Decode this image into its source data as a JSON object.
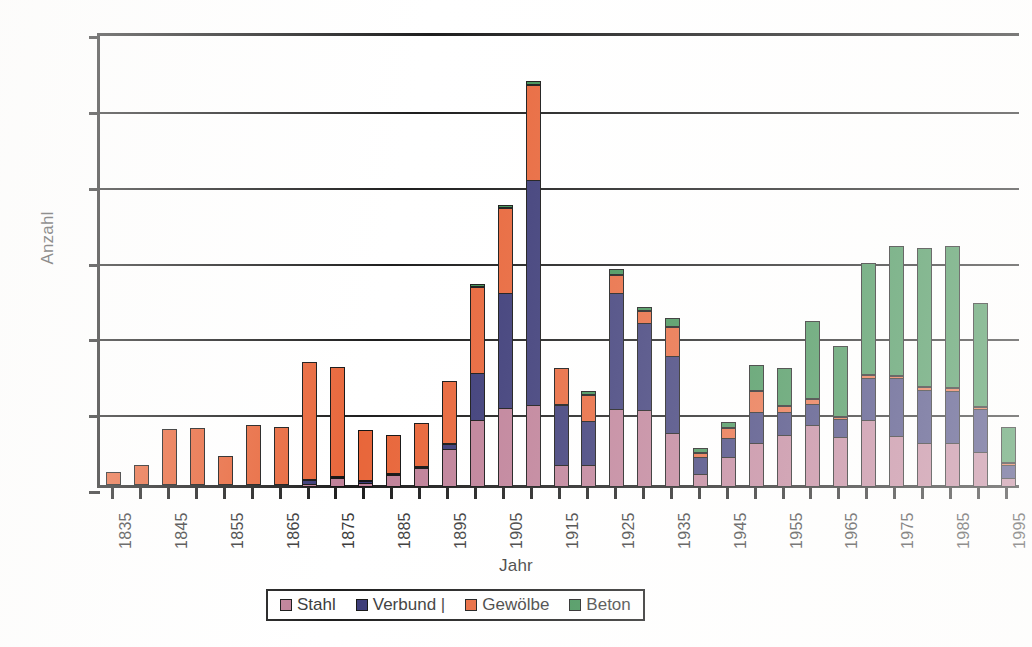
{
  "chart_data": {
    "type": "bar",
    "subtype": "stacked-vertical",
    "title": "",
    "xlabel": "Jahr",
    "ylabel": "Anzahl",
    "ylim": [
      0,
      3000
    ],
    "ytick_step": 500,
    "yticks": [
      0,
      500,
      1000,
      1500,
      2000,
      2500,
      3000
    ],
    "ytick_labels": [
      "0",
      "500",
      "1000",
      "1500",
      "2000",
      "2500",
      "3000"
    ],
    "grid": true,
    "grid_axis": "y",
    "legend_position": "bottom-center",
    "xtick_step": 5,
    "xtick_label_step": 10,
    "x_first": 1835,
    "x_last": 1995,
    "categories": [
      1835,
      1840,
      1845,
      1850,
      1855,
      1860,
      1865,
      1870,
      1875,
      1880,
      1885,
      1890,
      1895,
      1900,
      1905,
      1910,
      1915,
      1920,
      1925,
      1930,
      1935,
      1940,
      1945,
      1950,
      1955,
      1960,
      1965,
      1970,
      1975,
      1980,
      1985,
      1990,
      1995
    ],
    "xtick_labels": [
      "1835",
      "",
      "1845",
      "",
      "1855",
      "",
      "1865",
      "",
      "1875",
      "",
      "1885",
      "",
      "1895",
      "",
      "1905",
      "",
      "1915",
      "",
      "1925",
      "",
      "1935",
      "",
      "1945",
      "",
      "1955",
      "",
      "1965",
      "",
      "1975",
      "",
      "1985",
      "",
      "1995"
    ],
    "series": [
      {
        "name": "Stahl",
        "color": "#bf8098",
        "values": [
          0,
          0,
          0,
          0,
          0,
          0,
          0,
          0,
          0,
          0,
          0,
          0,
          0,
          0,
          0,
          0,
          0,
          0,
          0,
          0,
          0,
          0,
          0,
          0,
          0,
          0,
          0,
          0,
          0,
          0,
          0,
          0,
          0
        ]
      },
      {
        "name": "Verbund |",
        "color": "#3b3a77",
        "values": [
          0,
          0,
          0,
          0,
          0,
          0,
          0,
          0,
          0,
          0,
          0,
          0,
          0,
          0,
          0,
          0,
          0,
          0,
          0,
          0,
          0,
          0,
          0,
          0,
          0,
          0,
          0,
          0,
          0,
          0,
          0,
          0,
          0
        ]
      },
      {
        "name": "Gewölbe",
        "color": "#e8663a",
        "values": [
          0,
          0,
          0,
          0,
          0,
          0,
          0,
          0,
          0,
          0,
          0,
          0,
          0,
          0,
          0,
          0,
          0,
          0,
          0,
          0,
          0,
          0,
          0,
          0,
          0,
          0,
          0,
          0,
          0,
          0,
          0,
          0,
          0
        ]
      },
      {
        "name": "Beton",
        "color": "#3d8f52",
        "values": [
          0,
          0,
          0,
          0,
          0,
          0,
          0,
          0,
          0,
          0,
          0,
          0,
          0,
          0,
          0,
          0,
          0,
          0,
          0,
          0,
          0,
          0,
          0,
          0,
          0,
          0,
          0,
          0,
          0,
          0,
          0,
          0,
          0
        ]
      }
    ],
    "stacks": [
      {
        "year": 1835,
        "Stahl": 0,
        "Verbund": 0,
        "Gewoelbe": 85,
        "Beton": 0,
        "total": 85
      },
      {
        "year": 1840,
        "Stahl": 0,
        "Verbund": 0,
        "Gewoelbe": 135,
        "Beton": 0,
        "total": 135
      },
      {
        "year": 1845,
        "Stahl": 0,
        "Verbund": 0,
        "Gewoelbe": 370,
        "Beton": 0,
        "total": 370
      },
      {
        "year": 1850,
        "Stahl": 0,
        "Verbund": 0,
        "Gewoelbe": 375,
        "Beton": 0,
        "total": 375
      },
      {
        "year": 1855,
        "Stahl": 0,
        "Verbund": 0,
        "Gewoelbe": 190,
        "Beton": 0,
        "total": 190
      },
      {
        "year": 1860,
        "Stahl": 0,
        "Verbund": 0,
        "Gewoelbe": 395,
        "Beton": 0,
        "total": 395
      },
      {
        "year": 1865,
        "Stahl": 0,
        "Verbund": 0,
        "Gewoelbe": 385,
        "Beton": 0,
        "total": 385
      },
      {
        "year": 1870,
        "Stahl": 10,
        "Verbund": 35,
        "Gewoelbe": 780,
        "Beton": 0,
        "total": 825
      },
      {
        "year": 1875,
        "Stahl": 55,
        "Verbund": 10,
        "Gewoelbe": 725,
        "Beton": 0,
        "total": 790
      },
      {
        "year": 1880,
        "Stahl": 25,
        "Verbund": 5,
        "Gewoelbe": 340,
        "Beton": 0,
        "total": 370
      },
      {
        "year": 1885,
        "Stahl": 75,
        "Verbund": 15,
        "Gewoelbe": 255,
        "Beton": 0,
        "total": 345
      },
      {
        "year": 1890,
        "Stahl": 120,
        "Verbund": 20,
        "Gewoelbe": 290,
        "Beton": 0,
        "total": 430
      },
      {
        "year": 1895,
        "Stahl": 245,
        "Verbund": 45,
        "Gewoelbe": 415,
        "Beton": 0,
        "total": 705
      },
      {
        "year": 1900,
        "Stahl": 440,
        "Verbund": 320,
        "Gewoelbe": 580,
        "Beton": 15,
        "total": 1355
      },
      {
        "year": 1905,
        "Stahl": 520,
        "Verbund": 765,
        "Gewoelbe": 570,
        "Beton": 10,
        "total": 1865
      },
      {
        "year": 1910,
        "Stahl": 540,
        "Verbund": 1490,
        "Gewoelbe": 640,
        "Beton": 25,
        "total": 2695
      },
      {
        "year": 1915,
        "Stahl": 140,
        "Verbund": 410,
        "Gewoelbe": 240,
        "Beton": 0,
        "total": 790
      },
      {
        "year": 1920,
        "Stahl": 140,
        "Verbund": 300,
        "Gewoelbe": 185,
        "Beton": 25,
        "total": 650
      },
      {
        "year": 1925,
        "Stahl": 510,
        "Verbund": 780,
        "Gewoelbe": 125,
        "Beton": 40,
        "total": 1455
      },
      {
        "year": 1930,
        "Stahl": 505,
        "Verbund": 585,
        "Gewoelbe": 90,
        "Beton": 25,
        "total": 1205
      },
      {
        "year": 1935,
        "Stahl": 355,
        "Verbund": 520,
        "Gewoelbe": 200,
        "Beton": 55,
        "total": 1130
      },
      {
        "year": 1940,
        "Stahl": 80,
        "Verbund": 125,
        "Gewoelbe": 40,
        "Beton": 30,
        "total": 275
      },
      {
        "year": 1945,
        "Stahl": 195,
        "Verbund": 135,
        "Gewoelbe": 80,
        "Beton": 40,
        "total": 450
      },
      {
        "year": 1950,
        "Stahl": 290,
        "Verbund": 215,
        "Gewoelbe": 145,
        "Beton": 175,
        "total": 825
      },
      {
        "year": 1955,
        "Stahl": 340,
        "Verbund": 160,
        "Gewoelbe": 55,
        "Beton": 245,
        "total": 800
      },
      {
        "year": 1960,
        "Stahl": 405,
        "Verbund": 150,
        "Gewoelbe": 45,
        "Beton": 510,
        "total": 1110
      },
      {
        "year": 1965,
        "Stahl": 330,
        "Verbund": 125,
        "Gewoelbe": 25,
        "Beton": 465,
        "total": 945
      },
      {
        "year": 1970,
        "Stahl": 440,
        "Verbund": 290,
        "Gewoelbe": 25,
        "Beton": 740,
        "total": 1495
      },
      {
        "year": 1975,
        "Stahl": 335,
        "Verbund": 390,
        "Gewoelbe": 25,
        "Beton": 860,
        "total": 1610
      },
      {
        "year": 1980,
        "Stahl": 290,
        "Verbund": 355,
        "Gewoelbe": 30,
        "Beton": 920,
        "total": 1595
      },
      {
        "year": 1985,
        "Stahl": 290,
        "Verbund": 350,
        "Gewoelbe": 30,
        "Beton": 940,
        "total": 1610
      },
      {
        "year": 1990,
        "Stahl": 230,
        "Verbund": 290,
        "Gewoelbe": 25,
        "Beton": 685,
        "total": 1230
      },
      {
        "year": 1995,
        "Stahl": 55,
        "Verbund": 100,
        "Gewoelbe": 10,
        "Beton": 240,
        "total": 405
      }
    ]
  },
  "legend": {
    "items": [
      {
        "label": "Stahl",
        "color": "#bf8098"
      },
      {
        "label": "Verbund |",
        "color": "#3b3a77"
      },
      {
        "label": "Gewölbe",
        "color": "#e8663a"
      },
      {
        "label": "Beton",
        "color": "#3d8f52"
      }
    ]
  },
  "axes": {
    "y_title": "Anzahl",
    "x_title": "Jahr"
  }
}
